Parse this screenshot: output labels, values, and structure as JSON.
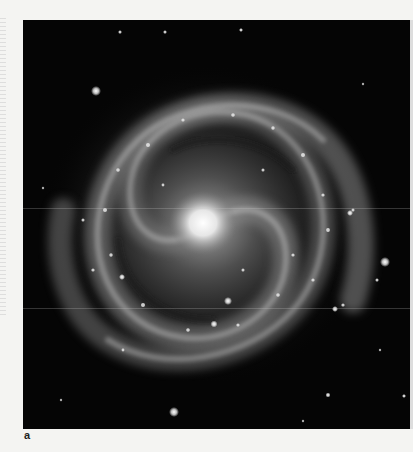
{
  "figure": {
    "panel_label": "a",
    "image_subject": "spiral-galaxy-photograph",
    "colors": {
      "background": "#050505",
      "page": "#f4f4f2",
      "core": "#f2f2f2",
      "arms": "#9a9a9a"
    }
  }
}
